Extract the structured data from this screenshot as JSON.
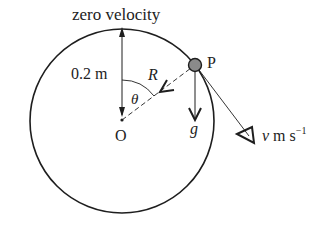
{
  "diagram": {
    "title_label": "zero velocity",
    "radius_label": "0.2 m",
    "center_label": "O",
    "point_label": "P",
    "reaction_label": "R",
    "angle_label": "θ",
    "gravity_label": "g",
    "velocity_label_v": "v",
    "velocity_label_units": " m s",
    "velocity_label_exp": "−1",
    "colors": {
      "stroke": "#1e1e1e",
      "particle_fill": "#8a8a8a",
      "background": "#ffffff"
    }
  }
}
